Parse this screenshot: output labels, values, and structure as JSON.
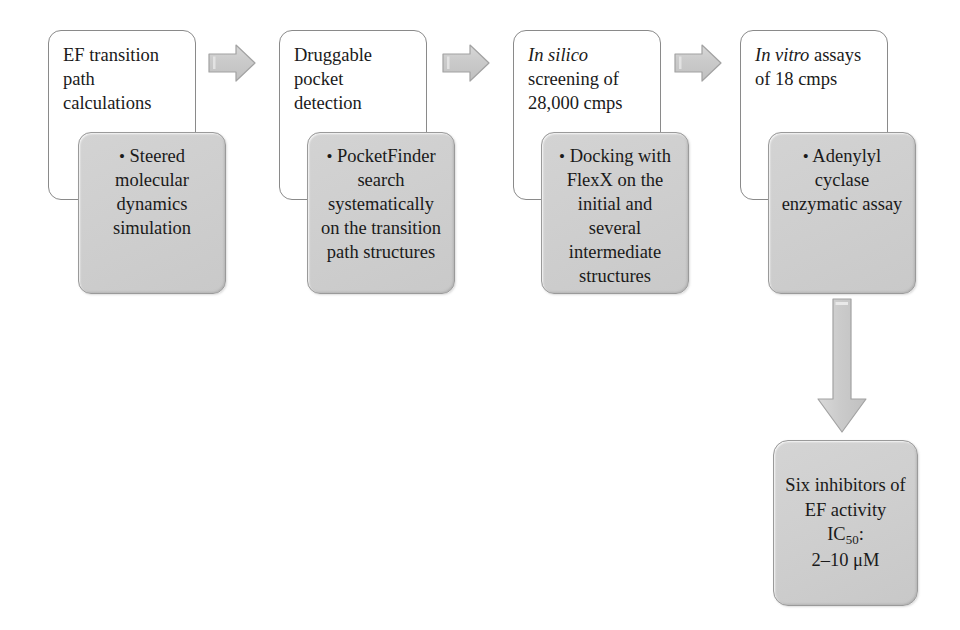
{
  "diagram": {
    "colors": {
      "white_card_fill": "#ffffff",
      "white_card_border": "#8a8a8a",
      "gray_card_fill": "#d0d0d0",
      "gray_card_border": "#9a9a9a",
      "arrow_fill": "#c8c8c8",
      "arrow_border": "#a0a0a0",
      "text": "#1a1a1a"
    },
    "stages": [
      {
        "id": "stage-1",
        "header": {
          "line1": "EF transition",
          "line2": "path",
          "line3": "calculations",
          "italic_prefix": ""
        },
        "detail": {
          "bullet": "•",
          "text": "Steered molecular dynamics simulation"
        }
      },
      {
        "id": "stage-2",
        "header": {
          "line1": "Druggable",
          "line2": "pocket",
          "line3": "detection",
          "italic_prefix": ""
        },
        "detail": {
          "bullet": "•",
          "text": "PocketFinder search systematically on the transition path structures"
        }
      },
      {
        "id": "stage-3",
        "header": {
          "line1": "screening of",
          "line2": "28,000 cmps",
          "line3": "",
          "italic_prefix": "In silico"
        },
        "detail": {
          "bullet": "•",
          "text": "Docking with FlexX on the initial and several intermediate structures"
        }
      },
      {
        "id": "stage-4",
        "header": {
          "line1": "assays",
          "line2": "of 18 cmps",
          "line3": "",
          "italic_prefix": "In vitro"
        },
        "detail": {
          "bullet": "•",
          "text": "Adenylyl cyclase enzymatic assay"
        }
      }
    ],
    "arrows": [
      {
        "id": "arrow-1-2",
        "direction": "right",
        "icon": "right-arrow-icon"
      },
      {
        "id": "arrow-2-3",
        "direction": "right",
        "icon": "right-arrow-icon"
      },
      {
        "id": "arrow-3-4",
        "direction": "right",
        "icon": "right-arrow-icon"
      },
      {
        "id": "arrow-4-result",
        "direction": "down",
        "icon": "down-arrow-icon"
      }
    ],
    "result": {
      "id": "result-box",
      "line1": "Six inhibitors of",
      "line2": "EF activity",
      "line3_label": "IC",
      "line3_subscript": "50",
      "line3_suffix": ":",
      "line4": "2–10 μM"
    }
  }
}
